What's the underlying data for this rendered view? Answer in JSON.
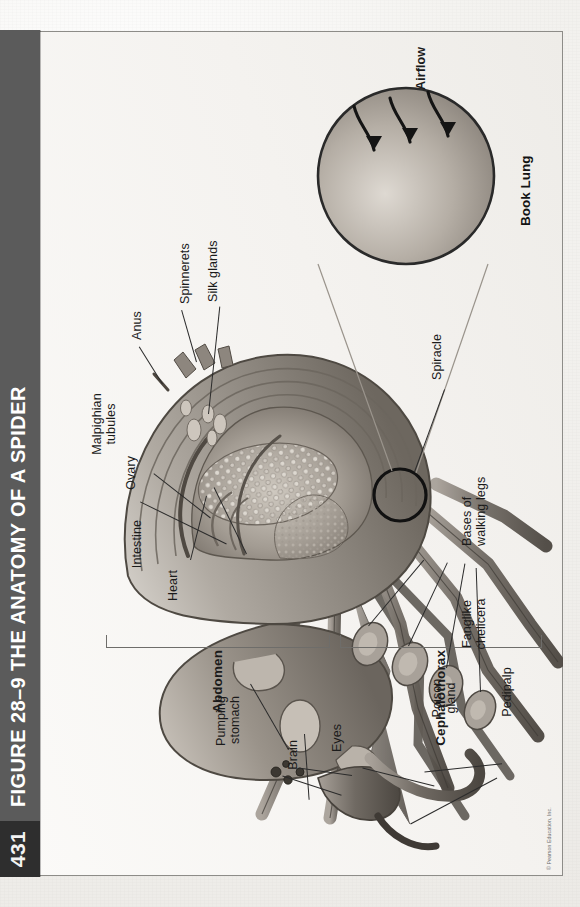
{
  "page": {
    "number": "431",
    "credit": "© Pearson Education, Inc."
  },
  "figure": {
    "label": "Figure 28–9",
    "title": "The Anatomy of a Spider",
    "full_title": "FIGURE 28–9 THE ANATOMY OF A SPIDER"
  },
  "body_regions": [
    {
      "name": "abdomen",
      "label": "Abdomen"
    },
    {
      "name": "cephalothorax",
      "label": "Cephalothorax"
    }
  ],
  "labels": [
    {
      "name": "heart",
      "label": "Heart"
    },
    {
      "name": "intestine",
      "label": "Intestine"
    },
    {
      "name": "ovary",
      "label": "Ovary"
    },
    {
      "name": "malpighian-tubules",
      "label": "Malpighian\ntubules"
    },
    {
      "name": "anus",
      "label": "Anus"
    },
    {
      "name": "spinnerets",
      "label": "Spinnerets"
    },
    {
      "name": "silk-glands",
      "label": "Silk glands"
    },
    {
      "name": "spiracle",
      "label": "Spiracle"
    },
    {
      "name": "pumping-stomach",
      "label": "Pumping\nstomach"
    },
    {
      "name": "brain",
      "label": "Brain"
    },
    {
      "name": "eyes",
      "label": "Eyes"
    },
    {
      "name": "poison-gland",
      "label": "Poison\ngland"
    },
    {
      "name": "pedipalp",
      "label": "Pedipalp"
    },
    {
      "name": "fanglike-chelicera",
      "label": "Fanglike\nchelicera"
    },
    {
      "name": "bases-of-walking-legs",
      "label": "Bases of\nwalking legs"
    }
  ],
  "inset": {
    "name": "book-lung-inset",
    "title": "Book Lung",
    "airflow_label": "Airflow"
  },
  "colors": {
    "title_bar": "#5b5b5b",
    "page_block": "#2e2e2e",
    "title_text": "#ffffff",
    "frame_border": "#8d8c88",
    "paper": "#f4f2ef",
    "label_text": "#1b1b1b",
    "leader_line": "#2b2b2b"
  }
}
